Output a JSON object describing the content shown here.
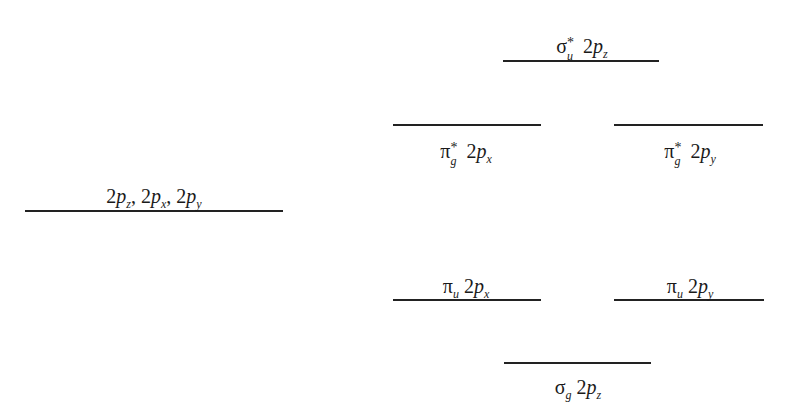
{
  "diagram": {
    "type": "molecular-orbital-energy-level-diagram",
    "atomic_orbitals": {
      "label_parts": [
        {
          "num": "2",
          "p": "p",
          "sub": "z",
          "sep": ", "
        },
        {
          "num": "2",
          "p": "p",
          "sub": "x",
          "sep": ", "
        },
        {
          "num": "2",
          "p": "p",
          "sub": "y",
          "sep": ""
        }
      ],
      "label_text": "2p_z, 2p_x, 2p_y",
      "line": {
        "x1": 25,
        "x2": 283,
        "y": 211
      },
      "label_pos": {
        "x": 156,
        "y": 186,
        "position": "above"
      }
    },
    "molecular_orbitals": [
      {
        "id": "sigma-u-star-2pz",
        "label_text": "σ*_u 2p_z",
        "symbol": "σ",
        "sup": "*",
        "sub": "u",
        "orbital_num": "2",
        "orbital_p": "p",
        "orbital_sub": "z",
        "line": {
          "x1": 503,
          "x2": 659,
          "y": 61
        },
        "label_pos": {
          "x": 581,
          "y": 36,
          "position": "above"
        }
      },
      {
        "id": "pi-g-star-2px",
        "label_text": "π*_g 2p_x",
        "symbol": "π",
        "sup": "*",
        "sub": "g",
        "orbital_num": "2",
        "orbital_p": "p",
        "orbital_sub": "x",
        "line": {
          "x1": 393,
          "x2": 541,
          "y": 125
        },
        "label_pos": {
          "x": 465,
          "y": 140,
          "position": "below"
        }
      },
      {
        "id": "pi-g-star-2py",
        "label_text": "π*_g 2p_y",
        "symbol": "π",
        "sup": "*",
        "sub": "g",
        "orbital_num": "2",
        "orbital_p": "p",
        "orbital_sub": "y",
        "line": {
          "x1": 614,
          "x2": 763,
          "y": 125
        },
        "label_pos": {
          "x": 689,
          "y": 140,
          "position": "below"
        }
      },
      {
        "id": "pi-u-2px",
        "label_text": "π_u 2p_x",
        "symbol": "π",
        "sup": "",
        "sub": "u",
        "orbital_num": "2",
        "orbital_p": "p",
        "orbital_sub": "x",
        "line": {
          "x1": 393,
          "x2": 541,
          "y": 300
        },
        "label_pos": {
          "x": 466,
          "y": 276,
          "position": "above"
        }
      },
      {
        "id": "pi-u-2py",
        "label_text": "π_u 2p_y",
        "symbol": "π",
        "sup": "",
        "sub": "u",
        "orbital_num": "2",
        "orbital_p": "p",
        "orbital_sub": "y",
        "line": {
          "x1": 614,
          "x2": 764,
          "y": 300
        },
        "label_pos": {
          "x": 690,
          "y": 276,
          "position": "above"
        }
      },
      {
        "id": "sigma-g-2pz",
        "label_text": "σ_g 2p_z",
        "symbol": "σ",
        "sup": "",
        "sub": "g",
        "orbital_num": "2",
        "orbital_p": "p",
        "orbital_sub": "z",
        "line": {
          "x1": 504,
          "x2": 651,
          "y": 363
        },
        "label_pos": {
          "x": 577,
          "y": 376,
          "position": "below"
        }
      }
    ],
    "colors": {
      "line": "#222222",
      "text": "#1a1a1a",
      "background": "#ffffff"
    }
  }
}
